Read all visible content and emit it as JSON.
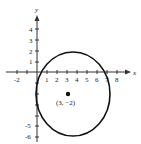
{
  "figure": {
    "x_axis_label": "x",
    "y_axis_label": "y",
    "x_ticks": [
      "-2",
      "1",
      "2",
      "3",
      "4",
      "5",
      "6",
      "7",
      "8"
    ],
    "y_ticks_positive": [
      "1",
      "2",
      "3",
      "4"
    ],
    "y_ticks_negative": [
      "-5",
      "-6"
    ],
    "center_label": "(3, −2)",
    "center": {
      "x": 3,
      "y": -2
    },
    "radius": 4,
    "stroke_color": "#111111"
  }
}
